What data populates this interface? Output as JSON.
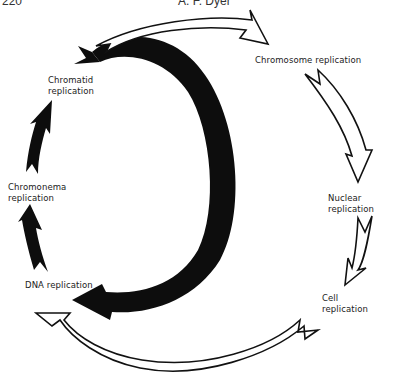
{
  "header": {
    "page_number": "220",
    "author": "A. F. Dyer"
  },
  "labels": {
    "chromatid": "Chromatid\nreplication",
    "chromonema": "Chromonema\nreplication",
    "dna": "DNA replication",
    "chromosome": "Chromosome replication",
    "nuclear": "Nuclear replication",
    "cell": "Cell\nreplication"
  },
  "colors": {
    "filled_arrow": "#0d0d0d",
    "outline_arrow_stroke": "#111111",
    "outline_arrow_fill": "#ffffff",
    "text": "#222222"
  }
}
